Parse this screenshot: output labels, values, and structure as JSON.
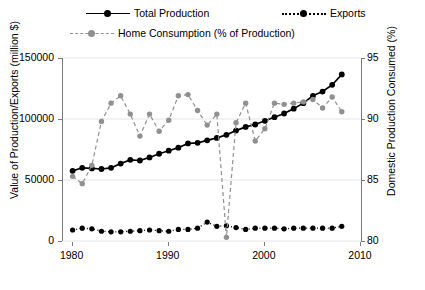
{
  "legend": {
    "entries": [
      {
        "id": "total",
        "label": "Total Production",
        "style": "solid-black",
        "color": "#000000"
      },
      {
        "id": "exports",
        "label": "Exports",
        "style": "dotted-black",
        "color": "#000000"
      },
      {
        "id": "home",
        "label": "Home Consumption (% of Production)",
        "style": "dashed-gray",
        "color": "#909090"
      }
    ]
  },
  "axes": {
    "left_title": "Value of Production/Exports (million $)",
    "right_title": "Domestic Production Consumed (%)",
    "left_ticks": [
      "150000",
      "100000",
      "50000",
      "0"
    ],
    "right_ticks": [
      "95",
      "90",
      "85",
      "80"
    ],
    "x_ticks": [
      "1980",
      "1990",
      "2000",
      "2010"
    ]
  },
  "chart_data": {
    "type": "line",
    "title": "",
    "xlabel": "",
    "ylabel": "Value of Production/Exports (million $)",
    "y2label": "Domestic Production Consumed (%)",
    "xlim": [
      1979,
      2010
    ],
    "ylim": [
      0,
      150000
    ],
    "y2lim": [
      80,
      95
    ],
    "grid": true,
    "legend_position": "top",
    "x": [
      1980,
      1981,
      1982,
      1983,
      1984,
      1985,
      1986,
      1987,
      1988,
      1989,
      1990,
      1991,
      1992,
      1993,
      1994,
      1995,
      1996,
      1997,
      1998,
      1999,
      2000,
      2001,
      2002,
      2003,
      2004,
      2005,
      2006,
      2007,
      2008
    ],
    "series": [
      {
        "name": "Total Production",
        "axis": "left",
        "units": "million $",
        "color": "#000000",
        "linestyle": "solid",
        "values": [
          57500,
          60000,
          59500,
          59000,
          60000,
          63500,
          66500,
          66000,
          68500,
          71500,
          74000,
          76500,
          80000,
          80500,
          82500,
          84500,
          87000,
          90500,
          93500,
          95500,
          98500,
          101500,
          104500,
          108500,
          113000,
          119000,
          122500,
          128000,
          136500
        ]
      },
      {
        "name": "Exports",
        "axis": "left",
        "units": "million $",
        "color": "#000000",
        "linestyle": "dotted",
        "values": [
          9000,
          10500,
          10000,
          8000,
          7500,
          7500,
          8000,
          8500,
          9000,
          8500,
          8000,
          9500,
          9500,
          10500,
          15500,
          12000,
          12500,
          11000,
          9500,
          10500,
          10500,
          10500,
          10000,
          10500,
          10500,
          10500,
          10500,
          10500,
          12000
        ]
      },
      {
        "name": "Home Consumption (% of Production)",
        "axis": "right",
        "units": "%",
        "color": "#909090",
        "linestyle": "dashed",
        "values": [
          85.3,
          84.7,
          86.2,
          89.8,
          91.3,
          91.9,
          90.4,
          88.6,
          90.4,
          89.0,
          89.9,
          91.9,
          92.0,
          90.7,
          89.5,
          90.4,
          80.3,
          89.7,
          91.3,
          88.2,
          89.2,
          91.3,
          91.2,
          91.3,
          91.4,
          91.6,
          90.9,
          91.8,
          90.6
        ]
      }
    ]
  }
}
